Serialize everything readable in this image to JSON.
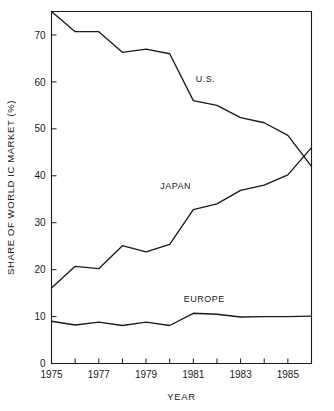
{
  "chart_data": {
    "type": "line",
    "title": "",
    "xlabel": "YEAR",
    "ylabel": "SHARE OF WORLD IC MARKET (%)",
    "xlim": [
      1975,
      1986
    ],
    "ylim": [
      0,
      75
    ],
    "grid": false,
    "legend_position": "inline-annotations",
    "x": [
      1975,
      1976,
      1977,
      1978,
      1979,
      1980,
      1981,
      1982,
      1983,
      1984,
      1985,
      1986
    ],
    "x_tick_labels": [
      "1975",
      "1977",
      "1979",
      "1981",
      "1983",
      "1985"
    ],
    "x_tick_values": [
      1975,
      1977,
      1979,
      1981,
      1983,
      1985
    ],
    "y_tick_labels": [
      "0",
      "10",
      "20",
      "30",
      "40",
      "50",
      "60",
      "70"
    ],
    "y_tick_values": [
      0,
      10,
      20,
      30,
      40,
      50,
      60,
      70
    ],
    "series": [
      {
        "name": "U.S.",
        "label": "U.S.",
        "color": "#1a1a1a",
        "values": [
          75.0,
          70.7,
          70.7,
          66.3,
          67.0,
          66.0,
          56.0,
          55.0,
          52.4,
          51.3,
          48.6,
          42.0
        ]
      },
      {
        "name": "JAPAN",
        "label": "JAPAN",
        "color": "#1a1a1a",
        "values": [
          16.1,
          20.7,
          20.2,
          25.1,
          23.8,
          25.4,
          32.8,
          34.0,
          36.9,
          38.0,
          40.2,
          46.0
        ]
      },
      {
        "name": "EUROPE",
        "label": "EUROPE",
        "color": "#1a1a1a",
        "values": [
          9.0,
          8.2,
          8.8,
          8.1,
          8.8,
          8.1,
          10.7,
          10.5,
          9.9,
          10.0,
          10.0,
          10.1
        ]
      }
    ],
    "annotations": [
      {
        "text": "U.S.",
        "x": 1981.1,
        "y": 60.0
      },
      {
        "text": "JAPAN",
        "x": 1979.6,
        "y": 37.2
      },
      {
        "text": "EUROPE",
        "x": 1980.6,
        "y": 13.0
      }
    ]
  }
}
